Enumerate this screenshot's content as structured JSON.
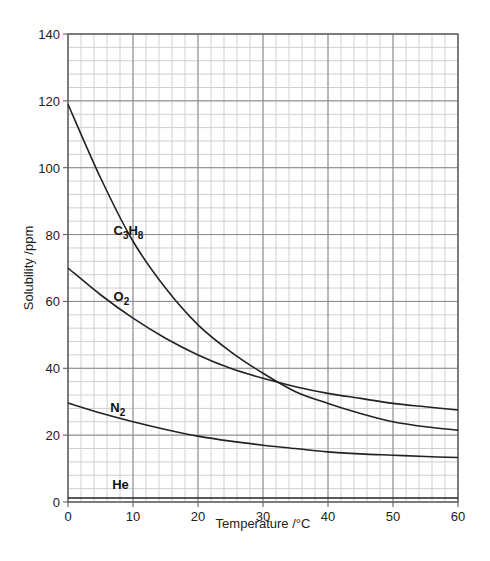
{
  "header": {
    "title": ""
  },
  "chart_data": {
    "type": "line",
    "title": "",
    "xlabel": "Temperature /°C",
    "ylabel": "Solubility /ppm",
    "xlim": [
      0,
      60
    ],
    "ylim": [
      0,
      140
    ],
    "xticks": [
      0,
      10,
      20,
      30,
      40,
      50,
      60
    ],
    "yticks": [
      0,
      20,
      40,
      60,
      80,
      100,
      120,
      140
    ],
    "x_minor_step": 2,
    "y_minor_step": 4,
    "grid": true,
    "legend": "inline labels",
    "x": [
      0,
      5,
      10,
      15,
      20,
      25,
      30,
      35,
      40,
      45,
      50,
      55,
      60
    ],
    "series": [
      {
        "name": "C3H8",
        "label_main": "C",
        "label_parts": [
          "C",
          "3",
          "H",
          "8"
        ],
        "label_at": [
          7,
          80
        ],
        "values": [
          119,
          97,
          78,
          64,
          53,
          45,
          38.5,
          33,
          29.5,
          26.5,
          24,
          22.5,
          21.5
        ]
      },
      {
        "name": "O2",
        "label_parts": [
          "O",
          "2"
        ],
        "label_at": [
          7,
          60
        ],
        "values": [
          70,
          62,
          55,
          49,
          44,
          40,
          37,
          34.5,
          32.5,
          31,
          29.5,
          28.5,
          27.5
        ]
      },
      {
        "name": "N2",
        "label_parts": [
          "N",
          "2"
        ],
        "label_at": [
          6.5,
          27
        ],
        "values": [
          29.6,
          26.6,
          24,
          21.7,
          19.7,
          18.2,
          17,
          16,
          15,
          14.4,
          14,
          13.6,
          13.3
        ]
      },
      {
        "name": "He",
        "label_parts": [
          "He"
        ],
        "label_at": [
          6.8,
          4
        ],
        "values": [
          1.2,
          1.2,
          1.2,
          1.2,
          1.2,
          1.2,
          1.2,
          1.2,
          1.2,
          1.2,
          1.2,
          1.2,
          1.2
        ]
      }
    ]
  }
}
